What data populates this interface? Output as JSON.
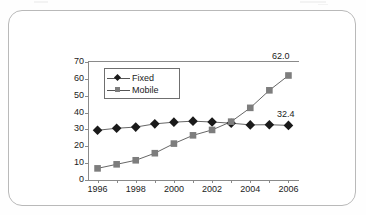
{
  "figure": {
    "frame_color": "#b9b9b9",
    "background": "#ffffff"
  },
  "legend": {
    "position": "inside-top-left",
    "entries": [
      {
        "label": "Fixed",
        "marker": "diamond",
        "color": "#1a1a1a"
      },
      {
        "label": "Mobile",
        "marker": "square",
        "color": "#7d7d7d"
      }
    ]
  },
  "annotations": [
    {
      "name": "mobile-end-value",
      "text": "62.0"
    },
    {
      "name": "fixed-end-value",
      "text": "32.4"
    }
  ],
  "chart_data": {
    "type": "line",
    "title": "",
    "xlabel": "",
    "ylabel": "",
    "x": [
      1996,
      1997,
      1998,
      1999,
      2000,
      2001,
      2002,
      2003,
      2004,
      2005,
      2006
    ],
    "tick_labels_x": [
      "1996",
      "",
      "1998",
      "",
      "2000",
      "",
      "2002",
      "",
      "2004",
      "",
      "2006"
    ],
    "tick_labels_y": [
      "0",
      "10",
      "20",
      "30",
      "40",
      "50",
      "60",
      "70"
    ],
    "ylim": [
      0,
      70
    ],
    "ytick_step": 10,
    "grid": false,
    "legend_position": "inside upper left",
    "series": [
      {
        "name": "Fixed",
        "marker": "diamond",
        "color": "#1a1a1a",
        "values": [
          29.5,
          30.7,
          31.4,
          33.3,
          34.3,
          34.9,
          34.4,
          33.7,
          32.7,
          32.8,
          32.4
        ],
        "end_label": "32.4"
      },
      {
        "name": "Mobile",
        "marker": "square",
        "color": "#7d7d7d",
        "values": [
          6.9,
          9.3,
          11.7,
          15.9,
          21.6,
          26.5,
          29.7,
          34.6,
          42.8,
          53.2,
          62.0
        ],
        "end_label": "62.0"
      }
    ]
  }
}
